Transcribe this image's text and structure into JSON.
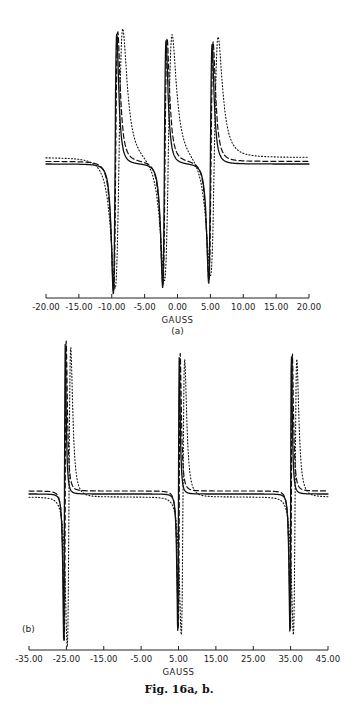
{
  "chart_data": [
    {
      "type": "line",
      "panel_label": "(a)",
      "xlabel": "GAUSS",
      "ylabel": "",
      "xlim": [
        -20,
        20
      ],
      "x_ticks": [
        "-20.00",
        "-15.00",
        "-10.00",
        "-5.00",
        "0.00",
        "5.00",
        "10.00",
        "15.00",
        "20.00"
      ],
      "x_tick_values": [
        -20,
        -15,
        -10,
        -5,
        0,
        5,
        10,
        15,
        20
      ],
      "grid": false,
      "legend": "none",
      "description": "Three-line derivative EPR spectrum; three overlaid simulated traces (solid, dashed, dotted)",
      "lines": [
        {
          "center": -9.5,
          "amplitude": 1.0
        },
        {
          "center": -2.0,
          "amplitude": 0.95
        },
        {
          "center": 5.0,
          "amplitude": 0.92
        }
      ],
      "series": [
        {
          "name": "solid",
          "style": "solid",
          "width": 0.45,
          "baseline": 0.0,
          "shift": 0.0
        },
        {
          "name": "dashed",
          "style": "dashed",
          "width": 0.55,
          "baseline": 0.02,
          "shift": 0.1
        },
        {
          "name": "dotted",
          "style": "dotted",
          "width": 1.0,
          "baseline": 0.05,
          "shift": 0.6
        }
      ]
    },
    {
      "type": "line",
      "panel_label": "(b)",
      "xlabel": "GAUSS",
      "ylabel": "",
      "xlim": [
        -35,
        45
      ],
      "x_ticks": [
        "-35.00",
        "-25.00",
        "-15.00",
        "-5.00",
        "5.00",
        "15.00",
        "25.00",
        "35.00",
        "45.00"
      ],
      "x_tick_values": [
        -35,
        -25,
        -15,
        -5,
        5,
        15,
        25,
        35,
        45
      ],
      "grid": false,
      "legend": "none",
      "description": "Three-line derivative EPR spectrum; three overlaid simulated traces (solid, dashed, dotted)",
      "lines": [
        {
          "center": -25.5,
          "amplitude": 1.0
        },
        {
          "center": 5.0,
          "amplitude": 0.92
        },
        {
          "center": 35.0,
          "amplitude": 0.92
        }
      ],
      "series": [
        {
          "name": "solid",
          "style": "solid",
          "width": 0.35,
          "baseline": 0.0,
          "shift": 0.0
        },
        {
          "name": "dashed",
          "style": "dashed",
          "width": 0.45,
          "baseline": 0.02,
          "shift": 0.2
        },
        {
          "name": "dotted",
          "style": "dotted",
          "width": 0.8,
          "baseline": -0.02,
          "shift": 1.2
        }
      ]
    }
  ],
  "caption": "Fig. 16a, b."
}
